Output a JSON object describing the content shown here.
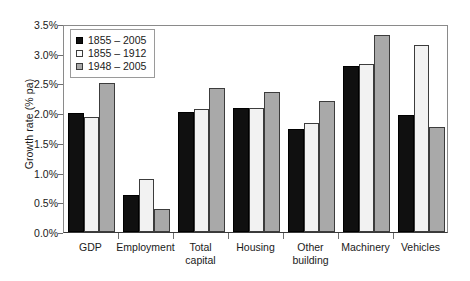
{
  "chart_data": {
    "type": "bar",
    "title": "",
    "xlabel": "",
    "ylabel": "Growth rate (% pa)",
    "ylim": [
      0,
      3.5
    ],
    "ytick_labels": [
      "0.0%",
      "0.5%",
      "1.0%",
      "1.5%",
      "2.0%",
      "2.5%",
      "3.0%",
      "3.5%"
    ],
    "ytick_values": [
      0,
      0.5,
      1.0,
      1.5,
      2.0,
      2.5,
      3.0,
      3.5
    ],
    "grid": false,
    "legend_position": "top-left",
    "categories": [
      "GDP",
      "Employment",
      "Total capital",
      "Housing",
      "Other building",
      "Machinery",
      "Vehicles"
    ],
    "category_label_lines": [
      [
        "GDP"
      ],
      [
        "Employment"
      ],
      [
        "Total",
        "capital"
      ],
      [
        "Housing"
      ],
      [
        "Other",
        "building"
      ],
      [
        "Machinery"
      ],
      [
        "Vehicles"
      ]
    ],
    "series": [
      {
        "name": "1855-2005",
        "color": "#101010",
        "values": [
          2.0,
          0.62,
          2.02,
          2.08,
          1.73,
          2.8,
          1.97
        ]
      },
      {
        "name": "1855-1912",
        "color": "#f2f2f2",
        "values": [
          1.93,
          0.89,
          2.07,
          2.08,
          1.83,
          2.82,
          3.14
        ]
      },
      {
        "name": "1948-2005",
        "color": "#a9a9a9",
        "values": [
          2.51,
          0.38,
          2.43,
          2.35,
          2.2,
          3.32,
          1.77
        ]
      }
    ]
  },
  "legend": {
    "items": [
      {
        "label": "1855 – 2005",
        "swatch": "black-square-icon"
      },
      {
        "label": "1855 – 1912",
        "swatch": "white-square-icon"
      },
      {
        "label": "1948 – 2005",
        "swatch": "gray-square-icon"
      }
    ]
  }
}
